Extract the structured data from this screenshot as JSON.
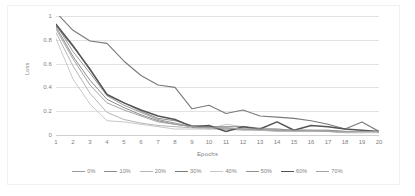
{
  "chart_data": {
    "type": "line",
    "title": "",
    "xlabel": "Epochs",
    "ylabel": "Loss",
    "xlim": [
      1,
      20
    ],
    "ylim": [
      0,
      1
    ],
    "grid": true,
    "legend_position": "bottom",
    "x": [
      1,
      2,
      3,
      4,
      5,
      6,
      7,
      8,
      9,
      10,
      11,
      12,
      13,
      14,
      15,
      16,
      17,
      18,
      19,
      20
    ],
    "y_ticks": [
      "0",
      "0.2",
      "0.4",
      "0.6",
      "0.8",
      "1"
    ],
    "y_tick_values": [
      0,
      0.2,
      0.4,
      0.6,
      0.8,
      1
    ],
    "x_ticks": [
      "1",
      "2",
      "3",
      "4",
      "5",
      "6",
      "7",
      "8",
      "9",
      "10",
      "11",
      "12",
      "13",
      "14",
      "15",
      "16",
      "17",
      "18",
      "19",
      "20"
    ],
    "series": [
      {
        "name": "0%",
        "color": "#9a9a9a",
        "width": 1.0,
        "values": [
          0.93,
          0.7,
          0.52,
          0.33,
          0.25,
          0.19,
          0.13,
          0.1,
          0.07,
          0.06,
          0.06,
          0.05,
          0.05,
          0.04,
          0.03,
          0.03,
          0.03,
          0.02,
          0.02,
          0.03
        ]
      },
      {
        "name": "10%",
        "color": "#8c8c8c",
        "width": 1.0,
        "values": [
          0.91,
          0.66,
          0.46,
          0.3,
          0.23,
          0.17,
          0.12,
          0.09,
          0.07,
          0.06,
          0.05,
          0.05,
          0.04,
          0.04,
          0.04,
          0.03,
          0.03,
          0.03,
          0.02,
          0.03
        ]
      },
      {
        "name": "20%",
        "color": "#b5b5b5",
        "width": 1.0,
        "values": [
          0.86,
          0.58,
          0.35,
          0.19,
          0.13,
          0.1,
          0.08,
          0.07,
          0.06,
          0.05,
          0.05,
          0.04,
          0.04,
          0.03,
          0.03,
          0.03,
          0.03,
          0.02,
          0.02,
          0.02
        ]
      },
      {
        "name": "30%",
        "color": "#7a7a7a",
        "width": 1.1,
        "values": [
          1.03,
          0.88,
          0.79,
          0.77,
          0.62,
          0.5,
          0.42,
          0.4,
          0.22,
          0.25,
          0.18,
          0.21,
          0.16,
          0.15,
          0.14,
          0.12,
          0.09,
          0.05,
          0.11,
          0.03
        ]
      },
      {
        "name": "40%",
        "color": "#c9c9c9",
        "width": 1.0,
        "values": [
          0.81,
          0.47,
          0.26,
          0.12,
          0.11,
          0.09,
          0.07,
          0.05,
          0.05,
          0.05,
          0.09,
          0.07,
          0.06,
          0.05,
          0.04,
          0.04,
          0.04,
          0.03,
          0.02,
          0.02
        ]
      },
      {
        "name": "50%",
        "color": "#8f8f8f",
        "width": 1.0,
        "values": [
          0.92,
          0.74,
          0.56,
          0.34,
          0.27,
          0.2,
          0.14,
          0.12,
          0.08,
          0.07,
          0.07,
          0.07,
          0.05,
          0.05,
          0.04,
          0.04,
          0.04,
          0.03,
          0.03,
          0.03
        ]
      },
      {
        "name": "60%",
        "color": "#555555",
        "width": 1.5,
        "values": [
          0.93,
          0.75,
          0.55,
          0.34,
          0.27,
          0.21,
          0.16,
          0.13,
          0.07,
          0.08,
          0.03,
          0.07,
          0.05,
          0.11,
          0.04,
          0.08,
          0.07,
          0.05,
          0.04,
          0.03
        ]
      },
      {
        "name": "70%",
        "color": "#a3a3a3",
        "width": 1.0,
        "values": [
          0.89,
          0.64,
          0.42,
          0.27,
          0.21,
          0.16,
          0.11,
          0.09,
          0.07,
          0.06,
          0.06,
          0.05,
          0.05,
          0.04,
          0.04,
          0.04,
          0.03,
          0.03,
          0.03,
          0.03
        ]
      }
    ]
  }
}
